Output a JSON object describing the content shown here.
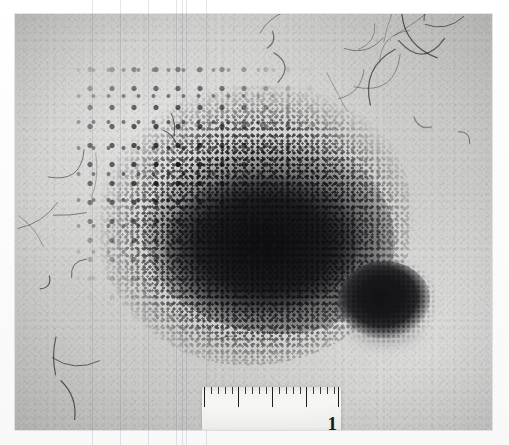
{
  "image": {
    "kind": "clinical-photograph",
    "modality": "black-and-white clinical dermatology photograph",
    "caption": "",
    "background_color": "#cfcfcd",
    "lesion_color": "#1a1a1c",
    "margin_color": "#fdfdfd"
  },
  "photo": {
    "left": 15,
    "top": 14,
    "width": 477,
    "height": 416
  },
  "features": {
    "main_lesion": {
      "name": "speckled pigmented patch",
      "center_x": 255,
      "center_y": 220,
      "width": 250,
      "height": 205,
      "tone": "dark brown-black, densely stippled centre with scattered macules at the periphery"
    },
    "satellite_nodule": {
      "name": "satellite nodule",
      "center_x": 369,
      "center_y": 286,
      "width": 92,
      "height": 78,
      "tone": "uniformly dark, well-circumscribed oval"
    },
    "hairs": {
      "name": "vellus hairs",
      "count": 24,
      "note": "fine curved hairs, densest in the upper right quadrant"
    }
  },
  "ruler": {
    "name": "measuring-ruler",
    "left": 187,
    "top": 373,
    "width": 139,
    "height": 47,
    "label": "1",
    "unit": "cm",
    "major_divisions": 4,
    "minor_per_major": 4,
    "major_tick_positions": [
      2,
      36,
      70,
      104,
      136
    ],
    "minor_tick_positions": [
      9,
      16,
      23,
      30,
      43,
      50,
      57,
      64,
      77,
      84,
      91,
      98,
      111,
      118,
      125,
      132
    ]
  },
  "scan_artifacts": {
    "name": "vertical-scan-lines",
    "line_positions": [
      92,
      120,
      148,
      176,
      182,
      186,
      206
    ]
  }
}
